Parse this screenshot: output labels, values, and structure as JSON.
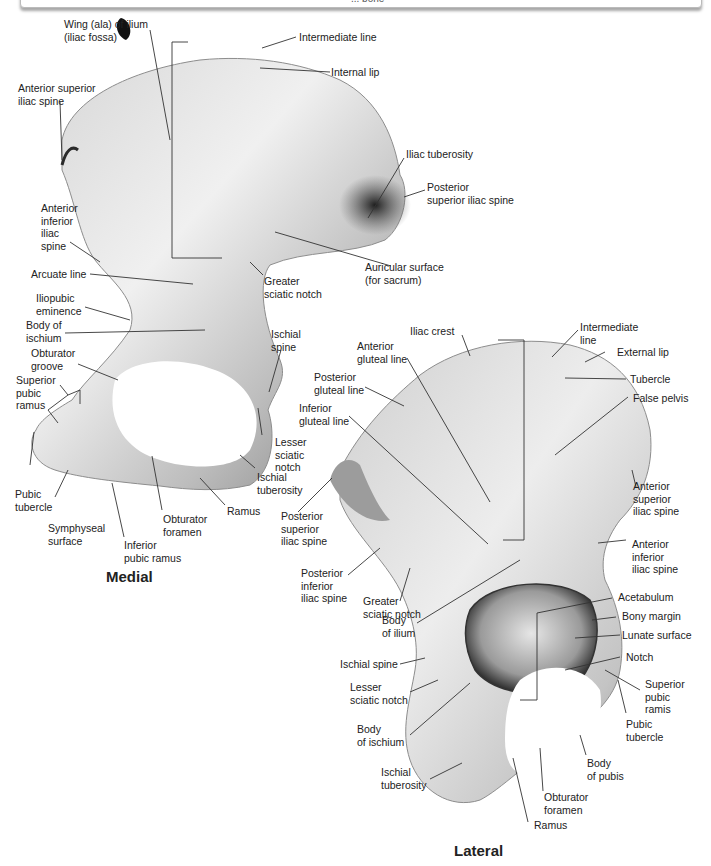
{
  "caption": "... bone",
  "figure": {
    "type": "anatomical illustration",
    "views": [
      {
        "title": "Medial",
        "labels": [
          {
            "id": "m-wing",
            "text": "Wing (ala) of ilium\n(iliac fossa)"
          },
          {
            "id": "m-intermediate-line",
            "text": "Intermediate line"
          },
          {
            "id": "m-internal-lip",
            "text": "Internal lip"
          },
          {
            "id": "m-asis",
            "text": "Anterior superior\niliac spine"
          },
          {
            "id": "m-iliac-tuberosity",
            "text": "Iliac tuberosity"
          },
          {
            "id": "m-psis",
            "text": "Posterior\nsuperior iliac spine"
          },
          {
            "id": "m-aiis",
            "text": "Anterior\ninferior\niliac\nspine"
          },
          {
            "id": "m-auricular",
            "text": "Auricular surface\n(for sacrum)"
          },
          {
            "id": "m-arcuate",
            "text": "Arcuate line"
          },
          {
            "id": "m-greater-sciatic",
            "text": "Greater\nsciatic notch"
          },
          {
            "id": "m-iliopubic",
            "text": "Iliopubic\neminence"
          },
          {
            "id": "m-body-ischium",
            "text": "Body of\nischium"
          },
          {
            "id": "m-ischial-spine",
            "text": "Ischial\nspine"
          },
          {
            "id": "m-obturator-groove",
            "text": "Obturator\ngroove"
          },
          {
            "id": "m-sup-pubic-ramus",
            "text": "Superior\npubic\nramus"
          },
          {
            "id": "m-lesser-sciatic",
            "text": "Lesser\nsciatic\nnotch"
          },
          {
            "id": "m-ischial-tuberosity",
            "text": "Ischial\ntuberosity"
          },
          {
            "id": "m-pubic-tubercle",
            "text": "Pubic\ntubercle"
          },
          {
            "id": "m-ramus",
            "text": "Ramus"
          },
          {
            "id": "m-obturator-foramen",
            "text": "Obturator\nforamen"
          },
          {
            "id": "m-symphyseal",
            "text": "Symphyseal\nsurface"
          },
          {
            "id": "m-inf-pubic-ramus",
            "text": "Inferior\npubic ramus"
          }
        ]
      },
      {
        "title": "Lateral",
        "labels": [
          {
            "id": "l-iliac-crest",
            "text": "Iliac crest"
          },
          {
            "id": "l-intermediate-line",
            "text": "Intermediate\nline"
          },
          {
            "id": "l-ant-gluteal",
            "text": "Anterior\ngluteal line"
          },
          {
            "id": "l-external-lip",
            "text": "External lip"
          },
          {
            "id": "l-post-gluteal",
            "text": "Posterior\ngluteal line"
          },
          {
            "id": "l-tubercle",
            "text": "Tubercle"
          },
          {
            "id": "l-inf-gluteal",
            "text": "Inferior\ngluteal line"
          },
          {
            "id": "l-false-pelvis",
            "text": "False pelvis"
          },
          {
            "id": "l-psis",
            "text": "Posterior\nsuperior\niliac spine"
          },
          {
            "id": "l-asis",
            "text": "Anterior\nsuperior\niliac spine"
          },
          {
            "id": "l-piis",
            "text": "Posterior\ninferior\niliac spine"
          },
          {
            "id": "l-greater-sciatic",
            "text": "Greater\nsciatic notch"
          },
          {
            "id": "l-aiis",
            "text": "Anterior\ninferior\niliac spine"
          },
          {
            "id": "l-body-ilium",
            "text": "Body\nof ilium"
          },
          {
            "id": "l-acetabulum",
            "text": "Acetabulum"
          },
          {
            "id": "l-bony-margin",
            "text": "Bony margin"
          },
          {
            "id": "l-lunate",
            "text": "Lunate surface"
          },
          {
            "id": "l-ischial-spine",
            "text": "Ischial spine"
          },
          {
            "id": "l-notch",
            "text": "Notch"
          },
          {
            "id": "l-lesser-sciatic",
            "text": "Lesser\nsciatic notch"
          },
          {
            "id": "l-sup-pubic-ramis",
            "text": "Superior\npubic\nramis"
          },
          {
            "id": "l-pubic-tubercle",
            "text": "Pubic\ntubercle"
          },
          {
            "id": "l-body-ischium",
            "text": "Body\nof ischium"
          },
          {
            "id": "l-body-pubis",
            "text": "Body\nof pubis"
          },
          {
            "id": "l-ischial-tuberosity",
            "text": "Ischial\ntuberosity"
          },
          {
            "id": "l-obturator-foramen",
            "text": "Obturator\nforamen"
          },
          {
            "id": "l-ramus",
            "text": "Ramus"
          }
        ]
      }
    ]
  },
  "colors": {
    "bone_light": "#f2f2f2",
    "bone_mid": "#c9c9c9",
    "bone_dark": "#3a3a3a",
    "leader": "#333333",
    "text": "#222222"
  }
}
